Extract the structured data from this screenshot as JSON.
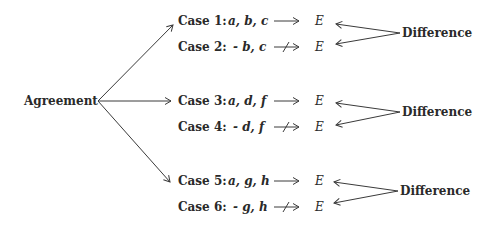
{
  "diagram": {
    "root": {
      "label": "Agreement"
    },
    "groups": [
      {
        "cases": [
          {
            "label": "Case 1:",
            "factors": "a, b, c",
            "relation": "causes",
            "effect": "E"
          },
          {
            "label": "Case 2:",
            "factors": "- b, c",
            "relation": "does-not-cause",
            "effect": "E"
          }
        ],
        "method": "Difference"
      },
      {
        "cases": [
          {
            "label": "Case 3:",
            "factors": "a, d, f",
            "relation": "causes",
            "effect": "E"
          },
          {
            "label": "Case 4:",
            "factors": "- d, f",
            "relation": "does-not-cause",
            "effect": "E"
          }
        ],
        "method": "Difference"
      },
      {
        "cases": [
          {
            "label": "Case 5:",
            "factors": "a, g, h",
            "relation": "causes",
            "effect": "E"
          },
          {
            "label": "Case 6:",
            "factors": "- g, h",
            "relation": "does-not-cause",
            "effect": "E"
          }
        ],
        "method": "Difference"
      }
    ],
    "colors": {
      "ink": "#2a2a2a",
      "background": "#ffffff"
    }
  }
}
